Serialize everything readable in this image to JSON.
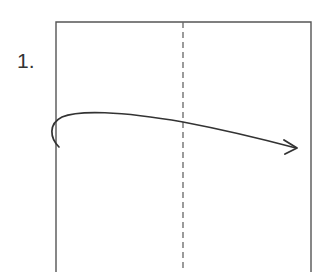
{
  "diagram": {
    "step_label": "1.",
    "paper": {
      "shape": "rectangle",
      "left": 56,
      "top": 22,
      "right": 311,
      "bottom_extends_beyond_view": true,
      "stroke_color": "#555555"
    },
    "fold_line": {
      "style": "dashed",
      "orientation": "vertical",
      "x": 183,
      "stroke_color": "#666666",
      "meaning": "valley fold line"
    },
    "arrow": {
      "type": "curved-fold-arrow",
      "direction": "left-to-right",
      "start": [
        59,
        147
      ],
      "end": [
        297,
        148
      ],
      "stroke_color": "#333333",
      "meaning": "fold left half over to the right"
    }
  }
}
